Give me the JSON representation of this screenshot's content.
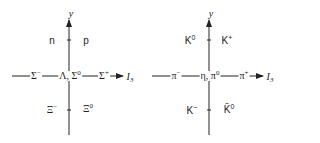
{
  "diagrams": [
    {
      "name": "baryon-octet",
      "axis_y_label": "y",
      "axis_x_label": "I",
      "axis_x_sub": "3",
      "labels": [
        {
          "id": "n",
          "text": "n",
          "sup": ""
        },
        {
          "id": "p",
          "text": "p",
          "sup": ""
        },
        {
          "id": "sigma-minus",
          "text": "Σ",
          "sup": "−"
        },
        {
          "id": "lambda-sigma0",
          "text": "Λ, Σ",
          "sup": "0"
        },
        {
          "id": "sigma-plus",
          "text": "Σ",
          "sup": "+"
        },
        {
          "id": "xi-minus",
          "text": "Ξ",
          "sup": "−"
        },
        {
          "id": "xi-zero",
          "text": "Ξ",
          "sup": "0"
        }
      ]
    },
    {
      "name": "meson-octet",
      "axis_y_label": "y",
      "axis_x_label": "I",
      "axis_x_sub": "3",
      "labels": [
        {
          "id": "k-zero",
          "text": "K",
          "sup": "0"
        },
        {
          "id": "k-plus",
          "text": "K",
          "sup": "+"
        },
        {
          "id": "pi-minus",
          "text": "π",
          "sup": "−"
        },
        {
          "id": "eta-pi0",
          "text": "η, π",
          "sup": "0"
        },
        {
          "id": "pi-plus",
          "text": "π",
          "sup": "+"
        },
        {
          "id": "k-minus",
          "text": "K",
          "sup": "−"
        },
        {
          "id": "k-bar-zero",
          "text": "K̄",
          "sup": "0"
        }
      ]
    }
  ],
  "colors": {
    "line": "#222222",
    "background": "#ffffff"
  }
}
